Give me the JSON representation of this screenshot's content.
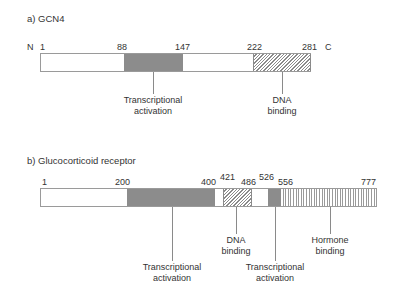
{
  "panels": [
    {
      "title": "a) GCN4",
      "n_terminus": "N",
      "c_terminus": "C",
      "length": 281,
      "ticks": [
        "1",
        "88",
        "147",
        "222",
        "281"
      ],
      "domains": [
        {
          "start": 88,
          "end": 147,
          "fill": "grey",
          "label_line1": "Transcriptional",
          "label_line2": "activation"
        },
        {
          "start": 222,
          "end": 281,
          "fill": "diagonal-hatch",
          "label_line1": "DNA",
          "label_line2": "binding"
        }
      ]
    },
    {
      "title": "b) Glucocorticoid receptor",
      "length": 777,
      "ticks": [
        "1",
        "200",
        "400",
        "421",
        "486",
        "526",
        "556",
        "777"
      ],
      "domains": [
        {
          "start": 200,
          "end": 400,
          "fill": "grey",
          "label_line1": "Transcriptional",
          "label_line2": "activation"
        },
        {
          "start": 421,
          "end": 486,
          "fill": "diagonal-hatch",
          "label_line1": "DNA",
          "label_line2": "binding"
        },
        {
          "start": 526,
          "end": 556,
          "fill": "grey",
          "label_line1": "Transcriptional",
          "label_line2": "activation"
        },
        {
          "start": 556,
          "end": 777,
          "fill": "vertical-stripes",
          "label_line1": "Hormone",
          "label_line2": "binding"
        }
      ]
    }
  ],
  "colors": {
    "grey_domain": "#8c8c8c",
    "outline": "#9a9a9a",
    "text": "#333333"
  }
}
